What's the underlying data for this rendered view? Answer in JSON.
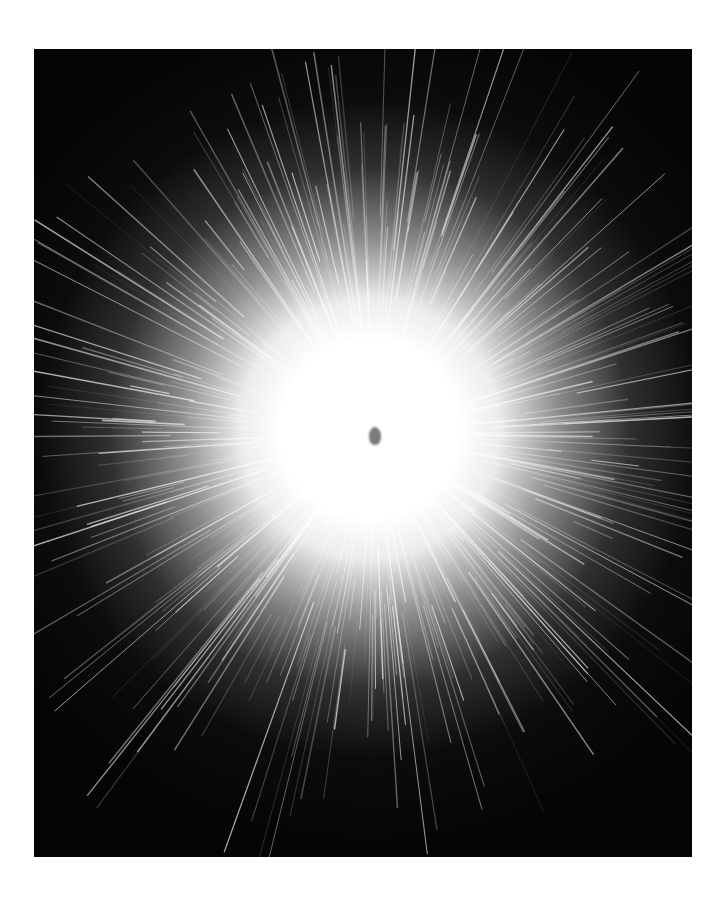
{
  "image": {
    "subject": "sparkler burst",
    "colors": {
      "background": "#ffffff",
      "photo_bg": "#050505",
      "glow": "#ffffff",
      "core": "#7a7a7a"
    }
  }
}
